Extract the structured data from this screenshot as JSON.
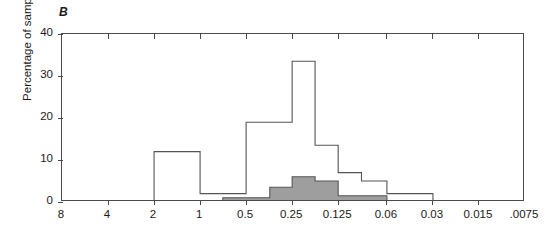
{
  "figure": {
    "panel_label": "B",
    "background_color": "#ffffff",
    "axis_color": "#4a4a4a"
  },
  "chart_data": {
    "type": "bar",
    "title": "B",
    "xlabel": "",
    "ylabel": "Percentage of sample",
    "ylim": [
      0,
      40
    ],
    "yticks": [
      0,
      10,
      20,
      30,
      40
    ],
    "ytick_labels": [
      "0",
      "10",
      "20",
      "30",
      "40"
    ],
    "xticks": [
      8,
      4,
      2,
      1,
      0.5,
      0.25,
      0.125,
      0.06,
      0.03,
      0.015,
      0.0075
    ],
    "xtick_labels": [
      "8",
      "4",
      "2",
      "1",
      "0.5",
      "0.25",
      "0.125",
      "0.06",
      "0.03",
      "0.015",
      ".0075"
    ],
    "x_scale": "log2-descending (two-fold dilution series)",
    "grid": false,
    "legend": "none",
    "series": [
      {
        "name": "All isolates (open outline)",
        "style": "step-outline",
        "fill_color": "#ffffff",
        "line_color": "#555555",
        "bins": [
          {
            "from": 8,
            "to": 4,
            "value": 0
          },
          {
            "from": 4,
            "to": 2,
            "value": 0
          },
          {
            "from": 2,
            "to": 1,
            "value": 12
          },
          {
            "from": 1,
            "to": 0.71,
            "value": 2
          },
          {
            "from": 0.71,
            "to": 0.5,
            "value": 2
          },
          {
            "from": 0.5,
            "to": 0.35,
            "value": 19
          },
          {
            "from": 0.35,
            "to": 0.25,
            "value": 19
          },
          {
            "from": 0.25,
            "to": 0.177,
            "value": 33.5
          },
          {
            "from": 0.177,
            "to": 0.125,
            "value": 13.5
          },
          {
            "from": 0.125,
            "to": 0.088,
            "value": 7
          },
          {
            "from": 0.088,
            "to": 0.06,
            "value": 5
          },
          {
            "from": 0.06,
            "to": 0.042,
            "value": 2
          },
          {
            "from": 0.042,
            "to": 0.03,
            "value": 2
          },
          {
            "from": 0.03,
            "to": 0.0075,
            "value": 0
          }
        ]
      },
      {
        "name": "Subset (shaded)",
        "style": "step-filled",
        "fill_color": "#9e9e9e",
        "line_color": "#555555",
        "bins": [
          {
            "from": 8,
            "to": 0.71,
            "value": 0
          },
          {
            "from": 0.71,
            "to": 0.5,
            "value": 1
          },
          {
            "from": 0.5,
            "to": 0.35,
            "value": 1
          },
          {
            "from": 0.35,
            "to": 0.25,
            "value": 3.5
          },
          {
            "from": 0.25,
            "to": 0.177,
            "value": 6
          },
          {
            "from": 0.177,
            "to": 0.125,
            "value": 5
          },
          {
            "from": 0.125,
            "to": 0.088,
            "value": 1.5
          },
          {
            "from": 0.088,
            "to": 0.06,
            "value": 1.5
          },
          {
            "from": 0.06,
            "to": 0.0075,
            "value": 0
          }
        ]
      }
    ]
  }
}
